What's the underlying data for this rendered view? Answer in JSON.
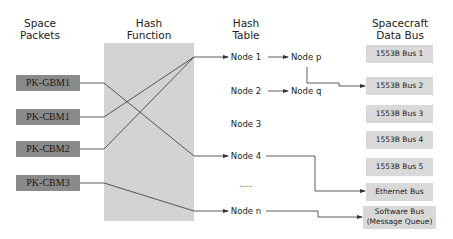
{
  "headers": {
    "packets": "Space\nPackets",
    "packets_l1": "Space",
    "packets_l2": "Packets",
    "hash_l1": "Hash",
    "hash_l2": "Function",
    "table_l1": "Hash",
    "table_l2": "Table",
    "bus_l1": "Spacecraft",
    "bus_l2": "Data Bus"
  },
  "packets": [
    "PK-GBM1",
    "PK-CBM1",
    "PK-CBM2",
    "PK-CBM3"
  ],
  "nodes": [
    "Node 1",
    "Node 2",
    "Node 3",
    "Node 4",
    "......",
    "Node n"
  ],
  "chain_nodes": [
    "Node p",
    "Node q"
  ],
  "buses": [
    "1553B Bus 1",
    "1553B Bus 2",
    "1553B Bus 3",
    "1553B Bus 4",
    "1553B Bus 5",
    "Ethernet Bus"
  ],
  "software_bus": {
    "line1": "Software Bus",
    "line2": "(Message Queue)"
  },
  "connections": [
    {
      "from": "PK-GBM1",
      "to": "Node 4"
    },
    {
      "from": "PK-CBM1",
      "to": "Node 1"
    },
    {
      "from": "PK-CBM2",
      "to": "Node 1"
    },
    {
      "from": "PK-CBM3",
      "to": "Node n"
    },
    {
      "from": "Node 1",
      "to": "Node p"
    },
    {
      "from": "Node 2",
      "to": "Node q"
    },
    {
      "from": "Node p",
      "to": "1553B Bus 2"
    },
    {
      "from": "Node 4",
      "to": "Ethernet Bus"
    },
    {
      "from": "Node n",
      "to": "Software Bus (Message Queue)"
    }
  ],
  "colors": {
    "packet_fill": "#8a8a8a",
    "hash_fill": "#d3d3d3",
    "bus_fill": "#d9d9d9",
    "line": "#333333"
  }
}
